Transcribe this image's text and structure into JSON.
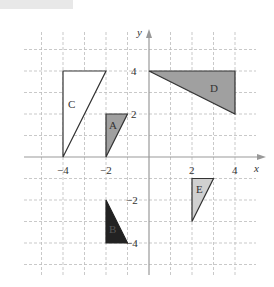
{
  "figure": {
    "axis_labels": {
      "x": "x",
      "y": "y"
    },
    "x_ticks": [
      {
        "value": -4,
        "label": "−4"
      },
      {
        "value": -2,
        "label": "−2"
      },
      {
        "value": 2,
        "label": "2"
      },
      {
        "value": 4,
        "label": "4"
      }
    ],
    "y_ticks": [
      {
        "value": 4,
        "label": "4"
      },
      {
        "value": 2,
        "label": "2"
      },
      {
        "value": -2,
        "label": "−2"
      },
      {
        "value": -4,
        "label": "−4"
      }
    ],
    "shapes": [
      {
        "name": "A",
        "vertices": [
          [
            -2,
            2
          ],
          [
            -1,
            2
          ],
          [
            -2,
            0
          ]
        ],
        "fill": "#a0a0a0"
      },
      {
        "name": "B",
        "vertices": [
          [
            -2,
            -2
          ],
          [
            -2,
            -4
          ],
          [
            -1,
            -4
          ]
        ],
        "fill": "#222222"
      },
      {
        "name": "C",
        "vertices": [
          [
            -4,
            4
          ],
          [
            -2,
            4
          ],
          [
            -4,
            0
          ]
        ],
        "fill": "#ffffff"
      },
      {
        "name": "D",
        "vertices": [
          [
            0,
            4
          ],
          [
            4,
            4
          ],
          [
            4,
            2
          ]
        ],
        "fill": "#a0a0a0"
      },
      {
        "name": "E",
        "vertices": [
          [
            2,
            -1
          ],
          [
            3,
            -1
          ],
          [
            2,
            -3
          ]
        ],
        "fill": "#d0d0d0"
      }
    ]
  },
  "labels": {
    "A": "A",
    "B": "B",
    "C": "C",
    "D": "D",
    "E": "E",
    "x": "x",
    "y": "y",
    "xm4": "−4",
    "xm2": "−2",
    "x2": "2",
    "x4": "4",
    "y4": "4",
    "y2": "2",
    "ym2": "−2",
    "ym4": "−4"
  }
}
